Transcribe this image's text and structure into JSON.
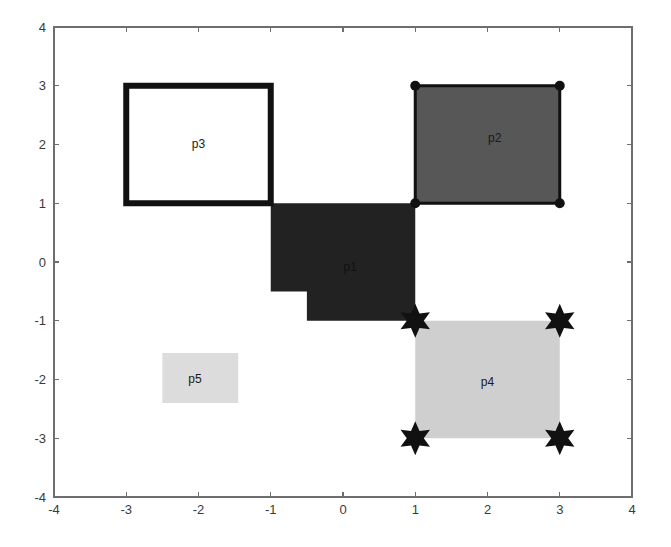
{
  "figure": {
    "background_color": "#ffffff",
    "plot_area": {
      "left": 54,
      "top": 27,
      "right": 632,
      "bottom": 497
    }
  },
  "axes": {
    "x_ticks": [
      "-4",
      "-3",
      "-2",
      "-1",
      "0",
      "1",
      "2",
      "3",
      "4"
    ],
    "y_ticks": [
      "4",
      "3",
      "2",
      "1",
      "0",
      "-1",
      "-2",
      "-3",
      "-4"
    ],
    "xlim": [
      -4,
      4
    ],
    "ylim": [
      -4,
      4
    ],
    "axis_color": "#6e6e6e",
    "tick_label_color": "#3a3a3a",
    "xlabel": "",
    "ylabel": "",
    "title": "",
    "grid": false
  },
  "chart_data": {
    "type": "polygon-map",
    "title": "",
    "xlabel": "",
    "ylabel": "",
    "xlim": [
      -4,
      4
    ],
    "ylim": [
      -4,
      4
    ],
    "grid": false,
    "legend": "none",
    "polygons": [
      {
        "name": "p1",
        "label": "p1",
        "label_position": [
          0.1,
          -0.1
        ],
        "fill": "#222222",
        "stroke": "none",
        "stroke_width": 0,
        "marker": "none",
        "label_color": "#111111",
        "vertices": [
          [
            -1,
            1
          ],
          [
            1,
            1
          ],
          [
            1,
            -1
          ],
          [
            -0.5,
            -1
          ],
          [
            -0.5,
            -0.5
          ],
          [
            -1,
            -0.5
          ]
        ]
      },
      {
        "name": "p2",
        "label": "p2",
        "label_position": [
          2.1,
          2.1
        ],
        "fill": "#575757",
        "stroke": "#111111",
        "stroke_width": 3,
        "marker": "circle",
        "marker_color": "#111111",
        "marker_size": 5,
        "label_color": "#1a1a1a",
        "vertices": [
          [
            1,
            1
          ],
          [
            1,
            3
          ],
          [
            3,
            3
          ],
          [
            3,
            1
          ]
        ]
      },
      {
        "name": "p3",
        "label": "p3",
        "label_position": [
          -2.0,
          2.0
        ],
        "fill": "none",
        "stroke": "#111111",
        "stroke_width": 6,
        "marker": "none",
        "label_color": "#1a1a1a",
        "vertices": [
          [
            -3,
            1
          ],
          [
            -3,
            3
          ],
          [
            -1,
            3
          ],
          [
            -1,
            1
          ]
        ]
      },
      {
        "name": "p4",
        "label": "p4",
        "label_position": [
          2.0,
          -2.05
        ],
        "fill": "#cfcfcf",
        "stroke": "none",
        "stroke_width": 0,
        "marker": "star6",
        "marker_color": "#111111",
        "marker_size": 17,
        "label_color": "#1a1a1a",
        "vertices": [
          [
            1,
            -3
          ],
          [
            1,
            -1
          ],
          [
            3,
            -1
          ],
          [
            3,
            -3
          ]
        ]
      },
      {
        "name": "p5",
        "label": "p5",
        "label_position": [
          -2.05,
          -2.0
        ],
        "fill": "#dcdcdc",
        "stroke": "none",
        "stroke_width": 0,
        "marker": "none",
        "label_color": "#1a1a1a",
        "vertices": [
          [
            -2.5,
            -2.4
          ],
          [
            -2.5,
            -1.55
          ],
          [
            -1.45,
            -1.55
          ],
          [
            -1.45,
            -2.4
          ]
        ]
      }
    ]
  }
}
